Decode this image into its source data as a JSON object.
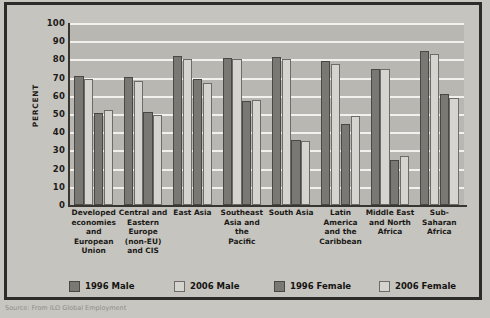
{
  "figure": {
    "y_axis_title": "PERCENT",
    "source_caption": "Source: From ILO Global Employment"
  },
  "legend": {
    "items": [
      {
        "label": "1996 Male",
        "tone": "dark"
      },
      {
        "label": "2006 Male",
        "tone": "light"
      },
      {
        "label": "1996 Female",
        "tone": "dark"
      },
      {
        "label": "2006 Female",
        "tone": "light"
      }
    ]
  },
  "chart_data": {
    "type": "bar",
    "title": "",
    "xlabel": "",
    "ylabel": "PERCENT",
    "ylim": [
      0,
      100
    ],
    "yticks": [
      0,
      10,
      20,
      30,
      40,
      50,
      60,
      70,
      80,
      90,
      100
    ],
    "grid": true,
    "legend_position": "bottom",
    "categories": [
      "Developed economies and European Union",
      "Central and Eastern Europe (non-EU) and CIS",
      "East Asia",
      "Southeast Asia and the Pacific",
      "South Asia",
      "Latin America and the Caribbean",
      "Middle East and North Africa",
      "Sub-Saharan Africa"
    ],
    "category_label_lines": [
      [
        "Developed",
        "economies",
        "and",
        "European",
        "Union"
      ],
      [
        "Central and",
        "Eastern",
        "Europe",
        "(non-EU)",
        "and CIS"
      ],
      [
        "East Asia"
      ],
      [
        "Southeast",
        "Asia and the",
        "Pacific"
      ],
      [
        "South Asia"
      ],
      [
        "Latin",
        "America",
        "and the",
        "Caribbean"
      ],
      [
        "Middle East",
        "and North",
        "Africa"
      ],
      [
        "Sub-",
        "Saharan",
        "Africa"
      ]
    ],
    "series": [
      {
        "name": "1996 Male",
        "tone": "dark",
        "values": [
          71,
          70.5,
          82,
          81,
          81.5,
          79,
          75,
          84.5
        ]
      },
      {
        "name": "2006 Male",
        "tone": "light",
        "values": [
          69,
          68,
          80,
          80.5,
          80,
          77.5,
          75,
          83
        ]
      },
      {
        "name": "1996 Female",
        "tone": "dark",
        "values": [
          50.5,
          51,
          69.5,
          57,
          35.5,
          44.5,
          24.5,
          61
        ]
      },
      {
        "name": "2006 Female",
        "tone": "light",
        "values": [
          52,
          49.5,
          67,
          57.5,
          35,
          49,
          27,
          59
        ]
      }
    ]
  }
}
